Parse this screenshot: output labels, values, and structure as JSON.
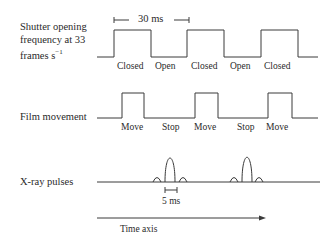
{
  "rows": {
    "shutter": {
      "label_lines": [
        "Shutter opening",
        "frequency at 33",
        "frames s"
      ],
      "label_sup": "−1",
      "period_label": "30 ms",
      "states": [
        "Closed",
        "Open",
        "Closed",
        "Open",
        "Closed"
      ]
    },
    "film": {
      "label": "Film movement",
      "states": [
        "Move",
        "Stop",
        "Move",
        "Stop",
        "Move"
      ]
    },
    "xray": {
      "label": "X-ray pulses",
      "pulse_width_label": "5 ms"
    }
  },
  "time_axis": {
    "label": "Time axis"
  }
}
